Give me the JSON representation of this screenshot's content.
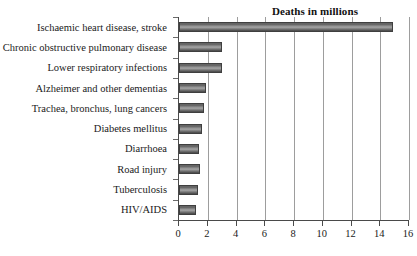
{
  "chart_data": {
    "type": "bar",
    "orientation": "horizontal",
    "title": "Deaths in millions",
    "xlabel": "",
    "ylabel": "",
    "xlim": [
      0,
      16
    ],
    "xticks": [
      0,
      2,
      4,
      6,
      8,
      10,
      12,
      14,
      16
    ],
    "grid": "vertical",
    "legend": "none",
    "bar_color": "#7d7d7d",
    "bar_edge_color": "#3f3f3f",
    "categories": [
      "Ischaemic heart disease, stroke",
      "Chronic obstructive pulmonary disease",
      "Lower respiratory infections",
      "Alzheimer and other dementias",
      "Trachea, bronchus, lung cancers",
      "Diabetes mellitus",
      "Diarrhoea",
      "Road injury",
      "Tuberculosis",
      "HIV/AIDS"
    ],
    "values": [
      14.9,
      3.0,
      3.0,
      1.9,
      1.75,
      1.6,
      1.4,
      1.45,
      1.3,
      1.2
    ],
    "series": [
      {
        "name": "Deaths in millions",
        "values": [
          14.9,
          3.0,
          3.0,
          1.9,
          1.75,
          1.6,
          1.4,
          1.45,
          1.3,
          1.2
        ]
      }
    ]
  }
}
